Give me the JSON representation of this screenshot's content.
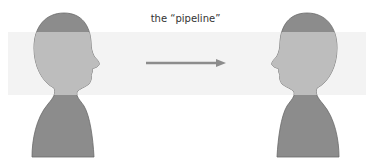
{
  "diagram": {
    "label": "the “pipeline”",
    "colors": {
      "band": "#f3f3f3",
      "head_dark": "#8c8c8c",
      "head_light": "#bdbdbd",
      "arrow": "#8c8c8c",
      "outline": "#6a6a6a"
    },
    "figures": [
      {
        "name": "left-head",
        "facing": "right"
      },
      {
        "name": "right-head",
        "facing": "left"
      }
    ],
    "arrow": {
      "from": "left-head",
      "to": "right-head",
      "direction": "right"
    }
  }
}
